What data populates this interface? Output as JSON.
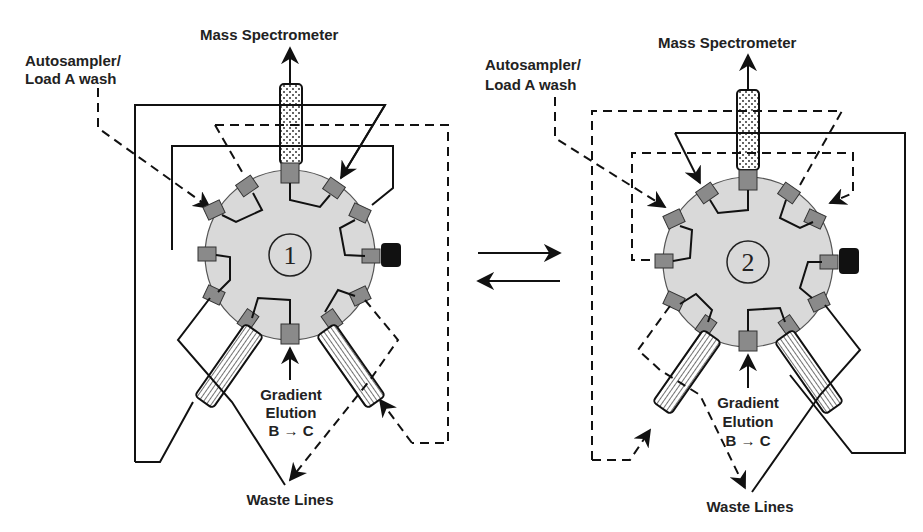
{
  "figure": {
    "valve_1": {
      "number": "1",
      "labels": {
        "mass_spec": "Mass Spectrometer",
        "autosampler_line1": "Autosampler/",
        "autosampler_line2": "Load A wash",
        "gradient_line1": "Gradient",
        "gradient_line2": "Elution",
        "gradient_line3": "B → C",
        "waste": "Waste Lines"
      }
    },
    "valve_2": {
      "number": "2",
      "labels": {
        "mass_spec": "Mass Spectrometer",
        "autosampler_line1": "Autosampler/",
        "autosampler_line2": "Load A wash",
        "gradient_line1": "Gradient",
        "gradient_line2": "Elution",
        "gradient_line3": "B → C",
        "waste": "Waste Lines"
      }
    },
    "switch_arrows": [
      "forward-arrow",
      "reverse-arrow"
    ],
    "colors": {
      "rotor": "#d9d9d9",
      "port": "#8a8a8a",
      "line": "#111111",
      "plug": "#111111"
    }
  }
}
